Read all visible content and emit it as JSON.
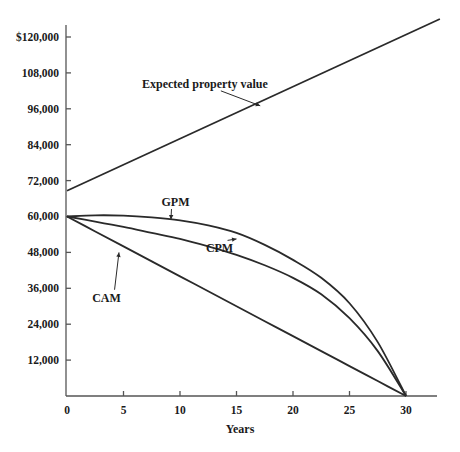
{
  "chart_data": {
    "type": "line",
    "title": "",
    "xlabel": "Years",
    "ylabel": "",
    "xlim": [
      0,
      33
    ],
    "ylim": [
      0,
      124000
    ],
    "grid": false,
    "x_ticks": [
      0,
      5,
      10,
      15,
      20,
      25,
      30
    ],
    "x_tick_labels": [
      "0",
      "5",
      "10",
      "15",
      "20",
      "25",
      "30"
    ],
    "y_ticks": [
      12000,
      24000,
      36000,
      48000,
      60000,
      72000,
      84000,
      96000,
      108000,
      120000
    ],
    "y_tick_labels": [
      "12,000",
      "24,000",
      "36,000",
      "48,000",
      "60,000",
      "72,000",
      "84,000",
      "96,000",
      "108,000",
      "$120,000"
    ],
    "x": [
      0,
      2.5,
      5,
      7.5,
      10,
      12.5,
      15,
      17.5,
      20,
      22.5,
      25,
      27.5,
      30
    ],
    "series": [
      {
        "name": "Expected property value",
        "x": [
          0,
          33
        ],
        "values": [
          68600,
          126000
        ]
      },
      {
        "name": "GPM",
        "values": [
          60000,
          60400,
          60300,
          59700,
          58700,
          57000,
          54500,
          50500,
          45500,
          39500,
          31000,
          18000,
          0
        ]
      },
      {
        "name": "CPM",
        "values": [
          60000,
          58300,
          56500,
          54500,
          52500,
          50000,
          47200,
          43700,
          39500,
          34000,
          26000,
          15000,
          0
        ]
      },
      {
        "name": "CAM",
        "values": [
          60000,
          55000,
          50000,
          45000,
          40000,
          35000,
          30000,
          25000,
          20000,
          15000,
          10000,
          5000,
          0
        ]
      }
    ],
    "annotations": [
      {
        "text": "Expected property value",
        "target_series": "Expected property value",
        "text_x": 12.2,
        "text_y": 103000,
        "arrow_to_x": 17.1,
        "arrow_to_y": 97000
      },
      {
        "text": "GPM",
        "target_series": "GPM",
        "text_x": 9.6,
        "text_y": 63500,
        "arrow_to_x": 9.2,
        "arrow_to_y": 59000
      },
      {
        "text": "CPM",
        "target_series": "CPM",
        "text_x": 13.5,
        "text_y": 48000,
        "arrow_to_x": 15.0,
        "arrow_to_y": 52500
      },
      {
        "text": "CAM",
        "target_series": "CAM",
        "text_x": 3.5,
        "text_y": 31500,
        "arrow_to_x": 4.6,
        "arrow_to_y": 48000
      }
    ]
  }
}
